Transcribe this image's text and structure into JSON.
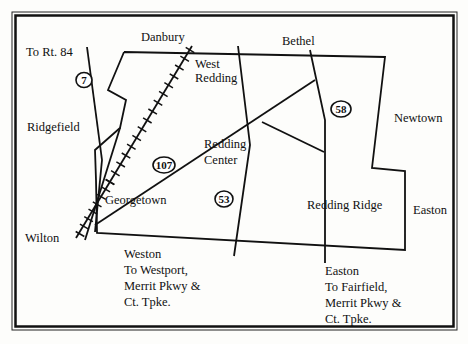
{
  "map": {
    "colors": {
      "ink": "#111111",
      "paper": "#fdfdfb"
    },
    "towns": {
      "danbury": "Danbury",
      "bethel": "Bethel",
      "to_rt84": "To Rt. 84",
      "west_redding_1": "West",
      "west_redding_2": "Redding",
      "ridgefield": "Ridgefield",
      "newtown": "Newtown",
      "redding_center_1": "Redding",
      "redding_center_2": "Center",
      "georgetown": "Georgetown",
      "redding_ridge": "Redding Ridge",
      "easton_east": "Easton",
      "wilton": "Wilton"
    },
    "directions": {
      "weston": [
        "Weston",
        "To Westport,",
        "Merrit Pkwy &",
        "Ct. Tpke."
      ],
      "easton": [
        "Easton",
        "To Fairfield,",
        "Merrit Pkwy &",
        "Ct. Tpke."
      ]
    },
    "routes": {
      "r7": "7",
      "r107": "107",
      "r53": "53",
      "r58": "58"
    },
    "legend_icons": [
      "railroad-track",
      "route-shield-oval",
      "town-boundary",
      "road-line"
    ]
  }
}
